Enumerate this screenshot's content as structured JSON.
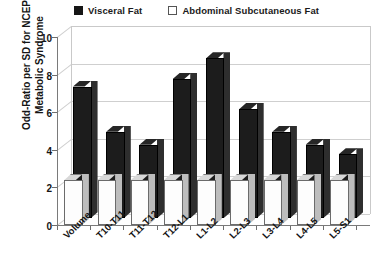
{
  "chart_data": {
    "type": "bar",
    "title": "",
    "xlabel": "",
    "ylabel": "Odd-Ratio per SD for NCEP Metabolic Syndrome",
    "ylabel_line1": "Odd-Ratio per SD for NCEP",
    "ylabel_line2": "Metabolic Syndrome",
    "ylim": [
      0,
      10
    ],
    "yticks": [
      0,
      2,
      4,
      6,
      8,
      10
    ],
    "ytick_labels": [
      "0",
      "2",
      "4",
      "6",
      "8",
      "10"
    ],
    "grid": true,
    "legend_position": "top",
    "style": "3d-column",
    "categories": [
      "Volume",
      "T10-T11",
      "T11-T12",
      "T12-L1",
      "L1-L2",
      "L2-L3",
      "L3-L4",
      "L4-L5",
      "L5-S1"
    ],
    "series": [
      {
        "name": "Visceral Fat",
        "marker": "filled-square",
        "color": "#1c1c1c",
        "values": [
          7.0,
          4.6,
          3.9,
          7.4,
          8.5,
          5.8,
          4.6,
          3.9,
          3.4
        ]
      },
      {
        "name": "Abdominal Subcutaneous Fat",
        "marker": "open-square",
        "color": "#fdfdfd",
        "values": [
          2.4,
          2.4,
          2.4,
          2.4,
          2.4,
          2.4,
          2.4,
          2.4,
          2.4
        ]
      }
    ]
  },
  "legend": {
    "items": [
      {
        "label": "Visceral Fat",
        "marker": "filled-square"
      },
      {
        "label": "Abdominal Subcutaneous Fat",
        "marker": "open-square"
      }
    ]
  },
  "colors": {
    "bar_visceral": "#1c1c1c",
    "bar_subcutaneous": "#fdfdfd",
    "grid": "#cfcfcf",
    "axis": "#7a7a7a",
    "text": "#151515"
  }
}
